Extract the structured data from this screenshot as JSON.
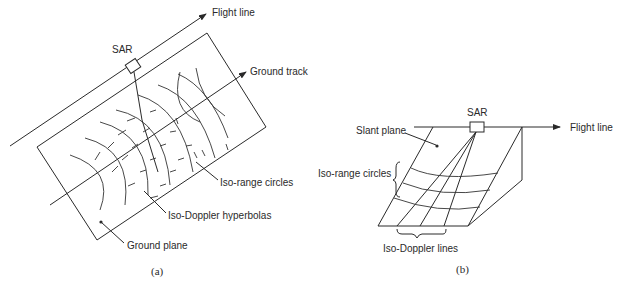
{
  "panel_a": {
    "caption": "(a)",
    "labels": {
      "flight_line": "Flight line",
      "sar": "SAR",
      "ground_track": "Ground track",
      "iso_range": "Iso-range circles",
      "iso_doppler": "Iso-Doppler hyperbolas",
      "ground_plane": "Ground plane"
    }
  },
  "panel_b": {
    "caption": "(b)",
    "labels": {
      "sar": "SAR",
      "flight_line": "Flight line",
      "slant_plane": "Slant plane",
      "iso_range": "Iso-range circles",
      "iso_doppler": "Iso-Doppler lines"
    }
  },
  "colors": {
    "line": "#2a2a2a",
    "background": "#ffffff"
  }
}
